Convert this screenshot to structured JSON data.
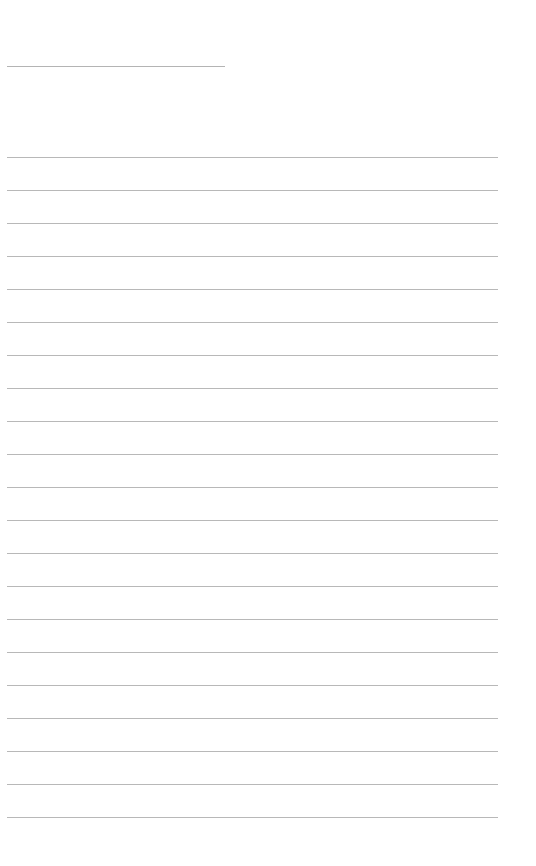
{
  "document": {
    "type": "lined-page",
    "background_color": "#ffffff",
    "line_color": "#b8b8b8",
    "title_line": {
      "text": "",
      "left": 7,
      "top": 66,
      "width": 218
    },
    "ruled_lines": {
      "count": 21,
      "first_top": 157,
      "spacing": 33,
      "left": 7,
      "width": 491,
      "lines": [
        "",
        "",
        "",
        "",
        "",
        "",
        "",
        "",
        "",
        "",
        "",
        "",
        "",
        "",
        "",
        "",
        "",
        "",
        "",
        "",
        ""
      ]
    }
  }
}
